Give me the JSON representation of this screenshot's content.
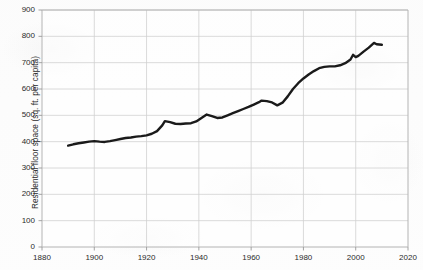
{
  "chart_data": {
    "type": "line",
    "title": "",
    "xlabel": "",
    "ylabel": "Residential floor space (sq. ft. per capita)",
    "xlim": [
      1880,
      2020
    ],
    "ylim": [
      0,
      900
    ],
    "xticks": [
      1880,
      1900,
      1920,
      1940,
      1960,
      1980,
      2000,
      2020
    ],
    "xtick_labels": [
      "1880",
      "1900",
      "1920",
      "1940",
      "1960",
      "1980",
      "2000",
      "2020"
    ],
    "yticks": [
      0,
      100,
      200,
      300,
      400,
      500,
      600,
      700,
      800,
      900
    ],
    "ytick_labels": [
      "0",
      "100",
      "200",
      "300",
      "400",
      "500",
      "600",
      "700",
      "800",
      "900"
    ],
    "grid": true,
    "grid_color": "#d0d0d0",
    "legend": false,
    "line_color": "#1a1a1a",
    "line_width": 2.4,
    "series": [
      {
        "name": "Residential floor space per capita",
        "x": [
          1890,
          1892,
          1894,
          1896,
          1898,
          1900,
          1902,
          1904,
          1906,
          1908,
          1910,
          1912,
          1914,
          1916,
          1918,
          1920,
          1922,
          1924,
          1926,
          1927,
          1929,
          1931,
          1933,
          1935,
          1937,
          1939,
          1941,
          1943,
          1945,
          1947,
          1949,
          1951,
          1953,
          1955,
          1957,
          1959,
          1961,
          1963,
          1964,
          1966,
          1968,
          1970,
          1972,
          1974,
          1976,
          1978,
          1980,
          1982,
          1984,
          1986,
          1988,
          1990,
          1992,
          1994,
          1996,
          1998,
          1999,
          2000,
          2001,
          2003,
          2005,
          2007,
          2008,
          2010
        ],
        "y": [
          385,
          390,
          394,
          397,
          400,
          402,
          400,
          399,
          402,
          406,
          410,
          414,
          416,
          419,
          421,
          424,
          430,
          440,
          462,
          478,
          474,
          468,
          467,
          469,
          470,
          477,
          490,
          503,
          497,
          490,
          492,
          500,
          508,
          516,
          524,
          532,
          541,
          550,
          556,
          554,
          549,
          538,
          548,
          572,
          600,
          622,
          640,
          655,
          668,
          679,
          684,
          686,
          686,
          690,
          698,
          712,
          730,
          721,
          726,
          742,
          757,
          775,
          770,
          768
        ]
      }
    ],
    "annotations": []
  },
  "figure": {
    "background_color": "#fdfdfd",
    "axis_color": "#b4b4b4"
  }
}
